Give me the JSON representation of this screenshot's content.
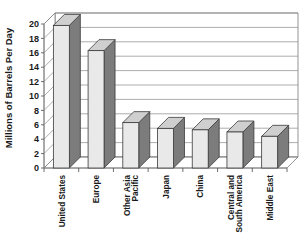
{
  "chart_data": {
    "type": "bar",
    "title": "",
    "subtitle": "",
    "xlabel": "",
    "ylabel": "Millions of Barrels Per Day",
    "ylim": [
      0,
      20
    ],
    "ytick_step": 2,
    "yticks": [
      20,
      18,
      16,
      14,
      12,
      10,
      8,
      6,
      4,
      2,
      0
    ],
    "grid": true,
    "legend": "none",
    "style": "3d-column",
    "categories": [
      "United States",
      "Other Asia Pacific",
      "Europe",
      "Japan",
      "China",
      "Central and South America",
      "Middle East"
    ],
    "category_lines": [
      [
        "United States"
      ],
      [
        "Europe"
      ],
      [
        "Other Asia",
        "Pacific"
      ],
      [
        "Japan"
      ],
      [
        "China"
      ],
      [
        "Central and",
        "South America"
      ],
      [
        "Middle East"
      ]
    ],
    "categories_ordered": [
      "United States",
      "Europe",
      "Other Asia Pacific",
      "Japan",
      "China",
      "Central and South America",
      "Middle East"
    ],
    "values": [
      19.8,
      16.3,
      6.3,
      5.5,
      5.3,
      5.0,
      4.4
    ],
    "colors": {
      "bar_front": "#e9e9e9",
      "bar_side": "#7c7c7c",
      "bar_top": "#cfcfcf",
      "gridline": "#8a8a8a",
      "text": "#1a1a1a",
      "background": "#ffffff"
    }
  },
  "axis": {
    "y_title": "Millions of Barrels Per Day"
  }
}
